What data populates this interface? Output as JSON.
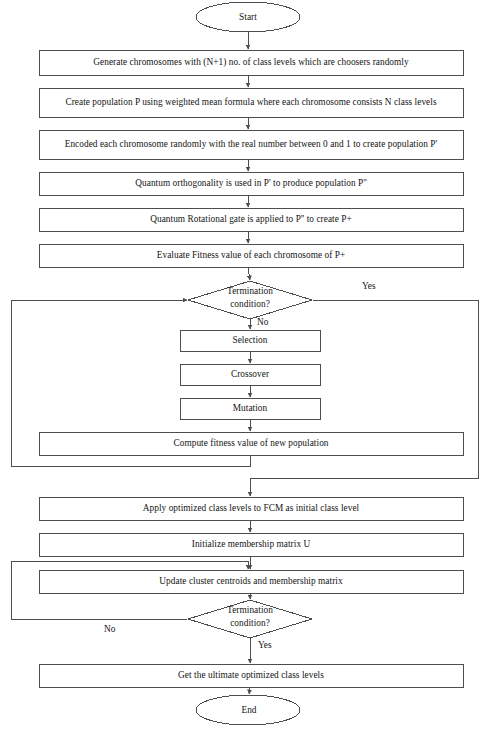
{
  "diagram": {
    "type": "flowchart",
    "width": 487,
    "height": 739,
    "stroke_color": "#4d4d4d",
    "text_color": "#141414",
    "background": "#ffffff"
  },
  "nodes": {
    "start": {
      "label": "Start",
      "shape": "terminator"
    },
    "generate": {
      "label": "Generate chromosomes with (N+1) no. of class levels which are choosers randomly",
      "shape": "process"
    },
    "create_population": {
      "label": "Create population P using weighted mean formula where each chromosome consists N class levels",
      "shape": "process"
    },
    "encode": {
      "label": "Encoded each chromosome randomly with the real number between 0 and 1 to create population P'",
      "shape": "process"
    },
    "orthogonality": {
      "label": "Quantum orthogonality is used in P' to produce population P''",
      "shape": "process"
    },
    "rotational_gate": {
      "label": "Quantum Rotational gate is applied to P'' to create P+",
      "shape": "process"
    },
    "evaluate_fitness": {
      "label": "Evaluate Fitness value of each chromosome of P+",
      "shape": "process"
    },
    "termination_1": {
      "label_line1": "Termination",
      "label_line2": "condition?",
      "shape": "decision"
    },
    "selection": {
      "label": "Selection",
      "shape": "process"
    },
    "crossover": {
      "label": "Crossover",
      "shape": "process"
    },
    "mutation": {
      "label": "Mutation",
      "shape": "process"
    },
    "compute_fitness": {
      "label": "Compute fitness value of new population",
      "shape": "process"
    },
    "apply_levels": {
      "label": "Apply optimized class levels to FCM as initial class level",
      "shape": "process"
    },
    "init_membership": {
      "label": "Initialize membership matrix U",
      "shape": "process"
    },
    "update_centroids": {
      "label": "Update cluster centroids and membership matrix",
      "shape": "process"
    },
    "termination_2": {
      "label_line1": "Termination",
      "label_line2": "condition?",
      "shape": "decision"
    },
    "get_levels": {
      "label": "Get the ultimate optimized class levels",
      "shape": "process"
    },
    "end": {
      "label": "End",
      "shape": "terminator"
    }
  },
  "edge_labels": {
    "termination_1_yes": "Yes",
    "termination_1_no": "No",
    "termination_2_no": "No",
    "termination_2_yes": "Yes"
  }
}
